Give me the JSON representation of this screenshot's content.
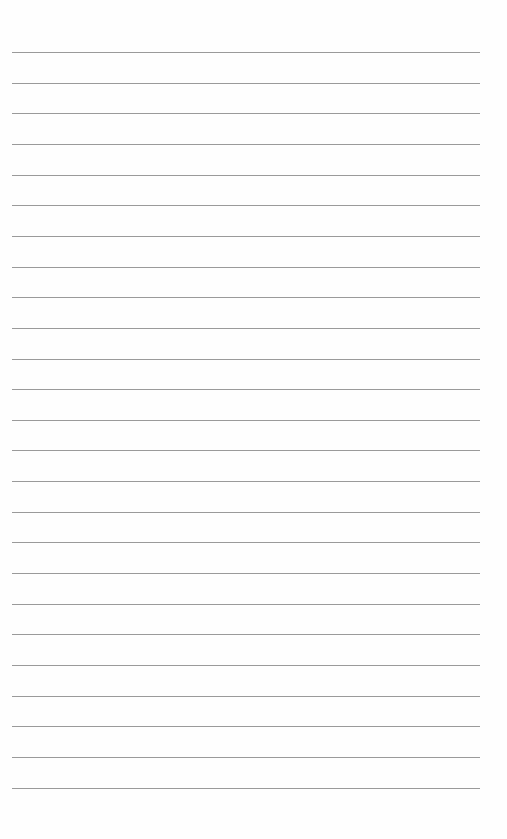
{
  "page": {
    "type": "blank lined paper",
    "line_count": 25,
    "first_line_y": 52,
    "line_spacing": 30.65,
    "line_left": 12,
    "line_width": 468,
    "line_color": "#9a9a9a",
    "background_color": "#fefefe"
  }
}
